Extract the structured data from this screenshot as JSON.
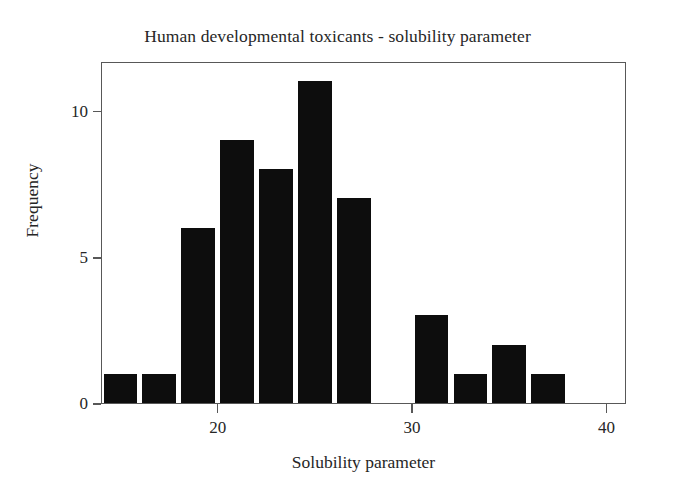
{
  "chart_data": {
    "type": "bar",
    "title": "Human developmental toxicants - solubility parameter",
    "xlabel": "Solubility parameter",
    "ylabel": "Frequency",
    "x": [
      15,
      17,
      19,
      21,
      23,
      25,
      27,
      31,
      33,
      35,
      37
    ],
    "values": [
      1,
      1,
      6,
      9,
      8,
      11,
      7,
      3,
      1,
      2,
      1
    ],
    "categories": [
      "15",
      "17",
      "19",
      "21",
      "23",
      "25",
      "27",
      "31",
      "33",
      "35",
      "37"
    ],
    "bin_width": 2,
    "xlim": [
      14,
      41
    ],
    "ylim": [
      0,
      11.7
    ],
    "xticks": [
      20,
      30,
      40
    ],
    "xticklabels": [
      "20",
      "30",
      "40"
    ],
    "yticks": [
      0,
      5,
      10
    ],
    "yticklabels": [
      "0",
      "5",
      "10"
    ],
    "grid": false,
    "legend": false,
    "bar_color": "#0d0d0d",
    "frame_color": "#585858",
    "background": "#ffffff"
  }
}
